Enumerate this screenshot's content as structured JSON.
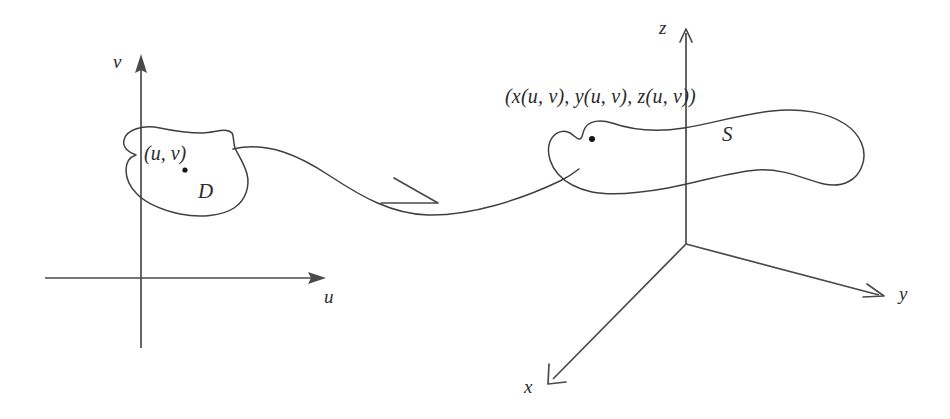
{
  "figure": {
    "background_color": "#ffffff",
    "ink_color": "#3a3a3a",
    "width": 950,
    "height": 419
  },
  "uv_plane": {
    "axis_v_label": "v",
    "axis_u_label": "u",
    "region_label": "D",
    "point_label": "(u, v)"
  },
  "xyz_space": {
    "axis_z_label": "z",
    "axis_y_label": "y",
    "axis_x_label": "x",
    "region_label": "S",
    "point_label": "(x(u, v), y(u, v), z(u, v))"
  },
  "mapping": {
    "arrow_name": "mapping-arrow"
  }
}
